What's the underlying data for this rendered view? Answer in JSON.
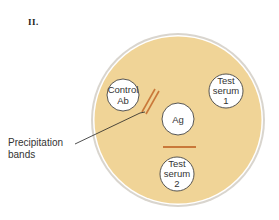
{
  "panel": {
    "label": "II."
  },
  "plate": {
    "cx": 178,
    "cy": 120,
    "r": 86,
    "fill": "#f0d497",
    "rim": "#c9c4bc",
    "wells": [
      {
        "id": "control-ab",
        "lines": [
          "Control",
          "Ab"
        ],
        "cx": 123,
        "cy": 95,
        "r": 16
      },
      {
        "id": "test-serum-1",
        "lines": [
          "Test",
          "serum",
          "1"
        ],
        "cx": 226,
        "cy": 91,
        "r": 17
      },
      {
        "id": "ag",
        "lines": [
          "Ag"
        ],
        "cx": 178,
        "cy": 119,
        "r": 16
      },
      {
        "id": "test-serum-2",
        "lines": [
          "Test",
          "serum",
          "2"
        ],
        "cx": 177,
        "cy": 174,
        "r": 17
      }
    ],
    "band_color": "#c9783a"
  },
  "callout": {
    "lines": [
      "Precipitation",
      "bands"
    ]
  }
}
